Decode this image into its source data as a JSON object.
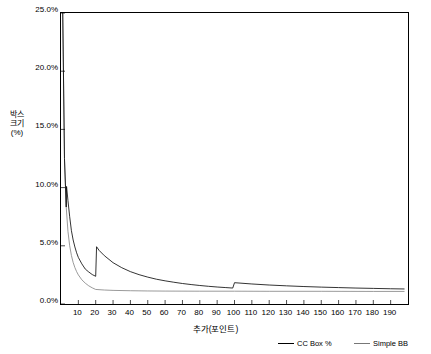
{
  "chart_data": {
    "type": "line",
    "title": "",
    "xlabel": "추가(포인트)",
    "ylabel": "박스크기(%)",
    "xlim": [
      0,
      200
    ],
    "ylim": [
      0,
      0.25
    ],
    "grid": false,
    "legend_position": "bottom-right",
    "y_tick_labels": [
      "0.0%",
      "5.0%",
      "10.0%",
      "15.0%",
      "20.0%",
      "25.0%"
    ],
    "y_tick_values": [
      0.0,
      0.05,
      0.1,
      0.15,
      0.2,
      0.25
    ],
    "x_tick_labels": [
      "10",
      "20",
      "30",
      "40",
      "50",
      "60",
      "70",
      "80",
      "90",
      "100",
      "110",
      "120",
      "130",
      "140",
      "150",
      "160",
      "170",
      "180",
      "190"
    ],
    "x_tick_values": [
      10,
      20,
      30,
      40,
      50,
      60,
      70,
      80,
      90,
      100,
      110,
      120,
      130,
      140,
      150,
      160,
      170,
      180,
      190
    ],
    "series": [
      {
        "name": "CC Box %",
        "color": "#000000",
        "points": [
          [
            1,
            0.25
          ],
          [
            2,
            0.125
          ],
          [
            3,
            0.0833
          ],
          [
            3.2,
            0.101
          ],
          [
            4,
            0.089
          ],
          [
            5,
            0.075
          ],
          [
            6,
            0.063
          ],
          [
            7,
            0.055
          ],
          [
            8,
            0.049
          ],
          [
            9,
            0.044
          ],
          [
            10,
            0.04
          ],
          [
            12,
            0.0345
          ],
          [
            14,
            0.03
          ],
          [
            16,
            0.0275
          ],
          [
            18,
            0.0253
          ],
          [
            20,
            0.0238
          ],
          [
            20.5,
            0.0492
          ],
          [
            22,
            0.046
          ],
          [
            25,
            0.0415
          ],
          [
            30,
            0.0355
          ],
          [
            35,
            0.0312
          ],
          [
            40,
            0.0278
          ],
          [
            45,
            0.0252
          ],
          [
            50,
            0.0231
          ],
          [
            55,
            0.0213
          ],
          [
            60,
            0.0199
          ],
          [
            65,
            0.0187
          ],
          [
            70,
            0.0176
          ],
          [
            75,
            0.0167
          ],
          [
            80,
            0.0159
          ],
          [
            85,
            0.0152
          ],
          [
            90,
            0.0146
          ],
          [
            95,
            0.0141
          ],
          [
            99,
            0.0137
          ],
          [
            100,
            0.0183
          ],
          [
            110,
            0.0172
          ],
          [
            120,
            0.0163
          ],
          [
            130,
            0.0156
          ],
          [
            140,
            0.015
          ],
          [
            150,
            0.0145
          ],
          [
            160,
            0.0141
          ],
          [
            170,
            0.0137
          ],
          [
            180,
            0.0134
          ],
          [
            190,
            0.0131
          ],
          [
            198,
            0.0129
          ]
        ]
      },
      {
        "name": "Simple BB",
        "color": "#808080",
        "points": [
          [
            1,
            0.25
          ],
          [
            2,
            0.125
          ],
          [
            3,
            0.0833
          ],
          [
            4,
            0.0625
          ],
          [
            5,
            0.05
          ],
          [
            6,
            0.0417
          ],
          [
            7,
            0.0357
          ],
          [
            8,
            0.0313
          ],
          [
            9,
            0.0278
          ],
          [
            10,
            0.025
          ],
          [
            12,
            0.0208
          ],
          [
            14,
            0.0179
          ],
          [
            16,
            0.0156
          ],
          [
            18,
            0.0139
          ],
          [
            20,
            0.0125
          ],
          [
            25,
            0.012
          ],
          [
            30,
            0.0117
          ],
          [
            40,
            0.0114
          ],
          [
            50,
            0.0112
          ],
          [
            60,
            0.0111
          ],
          [
            80,
            0.011
          ],
          [
            100,
            0.011
          ],
          [
            120,
            0.0109
          ],
          [
            150,
            0.0109
          ],
          [
            180,
            0.0108
          ],
          [
            198,
            0.0108
          ]
        ]
      }
    ]
  },
  "legend": {
    "items": [
      {
        "label": "CC Box %"
      },
      {
        "label": "Simple BB"
      }
    ]
  }
}
